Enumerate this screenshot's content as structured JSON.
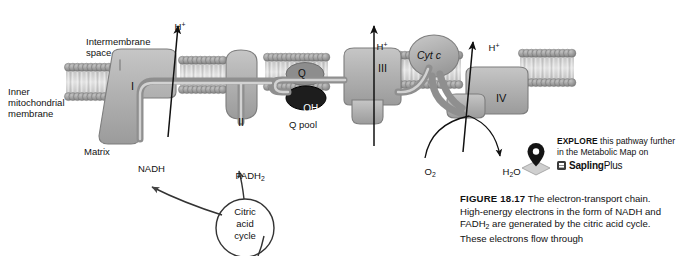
{
  "figure": {
    "labels": {
      "intermembrane_space": "Intermembrane\nspace",
      "inner_membrane": "Inner\nmitochondrial\nmembrane",
      "matrix": "Matrix",
      "q_pool": "Q pool",
      "nadh": "NADH",
      "citric_acid_cycle": "Citric\nacid\ncycle"
    },
    "complexes": [
      {
        "id": "complex-i",
        "label": "I"
      },
      {
        "id": "complex-ii",
        "label": "II"
      },
      {
        "id": "complex-iii",
        "label": "III"
      },
      {
        "id": "complex-iv",
        "label": "IV"
      }
    ],
    "carriers": [
      {
        "id": "q",
        "label": "Q"
      },
      {
        "id": "qh2",
        "label": "QH",
        "sub": "2"
      },
      {
        "id": "cyt-c",
        "label": "Cyt c"
      }
    ],
    "proton_arrows": [
      {
        "id": "h-plus-1",
        "label": "H",
        "sup": "+"
      },
      {
        "id": "h-plus-2",
        "label": "H",
        "sup": "+"
      },
      {
        "id": "h-plus-3",
        "label": "H",
        "sup": "+"
      }
    ],
    "molecules": [
      {
        "id": "fadh2",
        "label": "FADH",
        "sub": "2"
      },
      {
        "id": "oxygen",
        "label": "O",
        "sub": "2"
      },
      {
        "id": "water",
        "label": "H",
        "sub": "2",
        "tail": "O"
      }
    ]
  },
  "explore": {
    "keyword": "EXPLORE",
    "line1": " this pathway further",
    "line2": "in the Metabolic Map on",
    "brand": "Sapling",
    "brand_suffix": "Plus"
  },
  "caption": {
    "figure_number": "FIGURE 18.17",
    "body": " The electron-transport chain. High-energy electrons in the form of NADH and FADH",
    "body_sub": "2",
    "body_cont": " are generated by the citric acid cycle. These electrons flow through"
  },
  "colors": {
    "membrane_head": "#8d8d8d",
    "membrane_tail": "#c9c9c9",
    "complex_fill": "#b3b3b3",
    "complex_edge": "#7f7f7f",
    "q_fill": "#8a8a8a",
    "qh2_fill": "#1c1c1c",
    "arrow": "#111111",
    "background": "#ffffff"
  }
}
